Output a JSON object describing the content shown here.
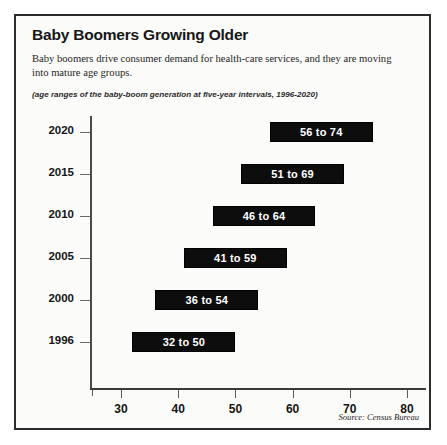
{
  "figure": {
    "title": "Baby Boomers Growing Older",
    "subtitle": "Baby boomers drive consumer demand for health-care services, and they are moving into mature age groups.",
    "note": "(age ranges of the baby-boom generation at five-year intervals, 1996-2020)",
    "source": "Source: Census Bureau"
  },
  "chart_data": {
    "type": "bar",
    "orientation": "horizontal",
    "subtype": "range-bar",
    "title": "Baby Boomers Growing Older",
    "subtitle": "Baby boomers drive consumer demand for health-care services, and they are moving into mature age groups.",
    "annotation": "(age ranges of the baby-boom generation at five-year intervals, 1996-2020)",
    "xlabel": "",
    "ylabel": "",
    "xlim": [
      27,
      86
    ],
    "xticks": [
      30,
      40,
      50,
      60,
      70,
      80
    ],
    "grid": false,
    "legend": false,
    "categories": [
      "2020",
      "2015",
      "2010",
      "2005",
      "2000",
      "1996"
    ],
    "bar_color": "#0d0d0d",
    "bar_label_color": "#ffffff",
    "bars": [
      {
        "category": "2020",
        "start": 56,
        "end": 74,
        "label": "56 to 74"
      },
      {
        "category": "2015",
        "start": 51,
        "end": 69,
        "label": "51 to 69"
      },
      {
        "category": "2010",
        "start": 46,
        "end": 64,
        "label": "46 to 64"
      },
      {
        "category": "2005",
        "start": 41,
        "end": 59,
        "label": "41 to 59"
      },
      {
        "category": "2000",
        "start": 36,
        "end": 54,
        "label": "36 to 54"
      },
      {
        "category": "1996",
        "start": 32,
        "end": 50,
        "label": "32 to 50"
      }
    ],
    "source": "Source: Census Bureau"
  }
}
